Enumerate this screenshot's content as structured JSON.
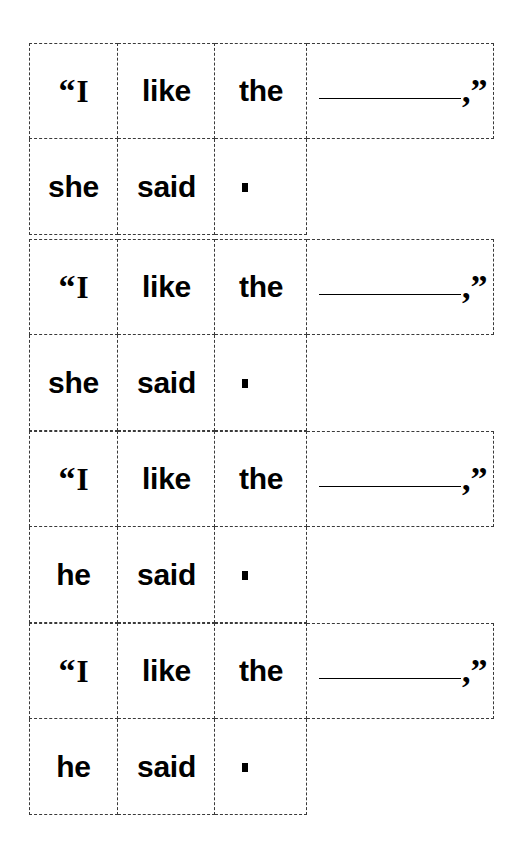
{
  "document": {
    "type": "sentence-building-worksheet",
    "background_color": "#ffffff",
    "text_color": "#000000",
    "border_color": "#3a3a3a",
    "blank_line_color": "#000000"
  },
  "grid": {
    "columns": 4,
    "rows": 8,
    "sentence_groups": 4
  },
  "glyphs": {
    "open_quote": "“",
    "close_quote": "”",
    "capital_i": "I",
    "comma": ",",
    "comma_quote": ",”",
    "period_mark": "."
  },
  "sentences": [
    {
      "id": 1,
      "quote_row": {
        "cells": [
          {
            "name": "open-quote-i",
            "text": "“I"
          },
          {
            "name": "word-like",
            "text": "like"
          },
          {
            "name": "word-the",
            "text": "the"
          },
          {
            "name": "blank-answer",
            "text": ",”"
          }
        ]
      },
      "tag_row": {
        "cells": [
          {
            "name": "pronoun",
            "text": "she"
          },
          {
            "name": "word-said",
            "text": "said"
          },
          {
            "name": "period",
            "text": "."
          }
        ]
      }
    },
    {
      "id": 2,
      "quote_row": {
        "cells": [
          {
            "name": "open-quote-i",
            "text": "“I"
          },
          {
            "name": "word-like",
            "text": "like"
          },
          {
            "name": "word-the",
            "text": "the"
          },
          {
            "name": "blank-answer",
            "text": ",”"
          }
        ]
      },
      "tag_row": {
        "cells": [
          {
            "name": "pronoun",
            "text": "she"
          },
          {
            "name": "word-said",
            "text": "said"
          },
          {
            "name": "period",
            "text": "."
          }
        ]
      }
    },
    {
      "id": 3,
      "quote_row": {
        "cells": [
          {
            "name": "open-quote-i",
            "text": "“I"
          },
          {
            "name": "word-like",
            "text": "like"
          },
          {
            "name": "word-the",
            "text": "the"
          },
          {
            "name": "blank-answer",
            "text": ",”"
          }
        ]
      },
      "tag_row": {
        "cells": [
          {
            "name": "pronoun",
            "text": "he"
          },
          {
            "name": "word-said",
            "text": "said"
          },
          {
            "name": "period",
            "text": "."
          }
        ]
      }
    },
    {
      "id": 4,
      "quote_row": {
        "cells": [
          {
            "name": "open-quote-i",
            "text": "“I"
          },
          {
            "name": "word-like",
            "text": "like"
          },
          {
            "name": "word-the",
            "text": "the"
          },
          {
            "name": "blank-answer",
            "text": ",”"
          }
        ]
      },
      "tag_row": {
        "cells": [
          {
            "name": "pronoun",
            "text": "he"
          },
          {
            "name": "word-said",
            "text": "said"
          },
          {
            "name": "period",
            "text": "."
          }
        ]
      }
    }
  ]
}
